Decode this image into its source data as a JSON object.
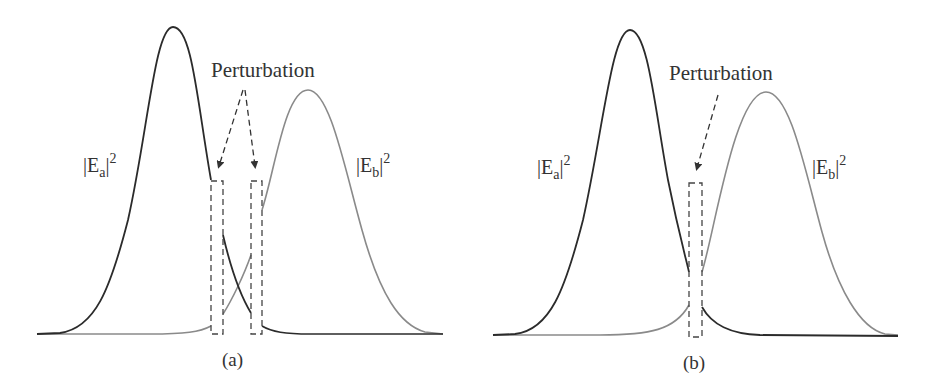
{
  "figure": {
    "panels": [
      {
        "id": "a",
        "caption": "(a)",
        "annotation": "Perturbation",
        "curve_a_label": {
          "base": "|E",
          "sub": "a",
          "tail": "|",
          "sup": "2"
        },
        "curve_b_label": {
          "base": "|E",
          "sub": "b",
          "tail": "|",
          "sup": "2"
        },
        "perturbation_regions": 2
      },
      {
        "id": "b",
        "caption": "(b)",
        "annotation": "Perturbation",
        "curve_a_label": {
          "base": "|E",
          "sub": "a",
          "tail": "|",
          "sup": "2"
        },
        "curve_b_label": {
          "base": "|E",
          "sub": "b",
          "tail": "|",
          "sup": "2"
        },
        "perturbation_regions": 1
      }
    ],
    "colors": {
      "curve_a": "#2b2b2b",
      "curve_b": "#8a8a8a",
      "dashed": "#444444",
      "text": "#333333"
    }
  }
}
